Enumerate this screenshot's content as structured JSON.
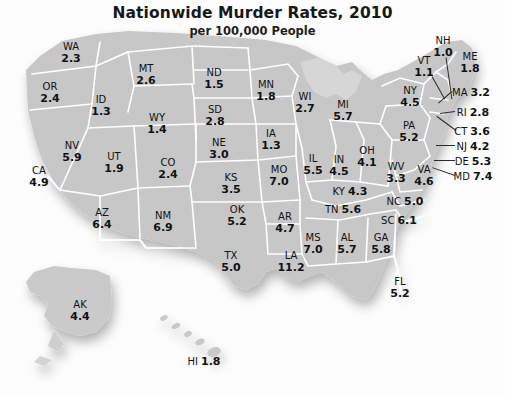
{
  "title": {
    "main": "Nationwide Murder Rates, 2010",
    "subtitle": "per 100,000 People"
  },
  "chart_data": {
    "type": "map",
    "title": "Nationwide Murder Rates, 2010",
    "subtitle": "per 100,000 People",
    "unit": "murders per 100,000 people",
    "region": "United States",
    "year": 2010,
    "value_range": [
      1.0,
      11.2
    ],
    "min_state": "NH",
    "max_state": "LA",
    "legend": "none",
    "grid": false,
    "categories": [
      "WA",
      "OR",
      "CA",
      "NV",
      "ID",
      "MT",
      "WY",
      "UT",
      "AZ",
      "CO",
      "NM",
      "ND",
      "SD",
      "NE",
      "KS",
      "OK",
      "TX",
      "MN",
      "IA",
      "MO",
      "AR",
      "LA",
      "WI",
      "IL",
      "MS",
      "MI",
      "IN",
      "KY",
      "TN",
      "AL",
      "GA",
      "FL",
      "OH",
      "WV",
      "VA",
      "NC",
      "SC",
      "PA",
      "NY",
      "VT",
      "NH",
      "ME",
      "MA",
      "RI",
      "CT",
      "NJ",
      "DE",
      "MD",
      "AK",
      "HI"
    ],
    "values": [
      2.3,
      2.4,
      4.9,
      5.9,
      1.3,
      2.6,
      1.4,
      1.9,
      6.4,
      2.4,
      6.9,
      1.5,
      2.8,
      3.0,
      3.5,
      5.2,
      5.0,
      1.8,
      1.3,
      7.0,
      4.7,
      11.2,
      2.7,
      5.5,
      7.0,
      5.7,
      4.5,
      4.3,
      5.6,
      5.7,
      5.8,
      5.2,
      4.1,
      3.3,
      4.6,
      5.0,
      6.1,
      5.2,
      4.5,
      1.1,
      1.0,
      1.8,
      3.2,
      2.8,
      3.6,
      4.2,
      5.3,
      7.4,
      4.4,
      1.8
    ],
    "states": [
      {
        "abbr": "WA",
        "value": "2.3",
        "x": 71,
        "y": 52,
        "style": "stacked"
      },
      {
        "abbr": "OR",
        "value": "2.4",
        "x": 50,
        "y": 92,
        "style": "stacked"
      },
      {
        "abbr": "ID",
        "value": "1.3",
        "x": 101,
        "y": 105,
        "style": "stacked"
      },
      {
        "abbr": "MT",
        "value": "2.6",
        "x": 146,
        "y": 74,
        "style": "stacked"
      },
      {
        "abbr": "WY",
        "value": "1.4",
        "x": 157,
        "y": 123,
        "style": "stacked"
      },
      {
        "abbr": "NV",
        "value": "5.9",
        "x": 72,
        "y": 151,
        "style": "stacked"
      },
      {
        "abbr": "UT",
        "value": "1.9",
        "x": 114,
        "y": 162,
        "style": "stacked"
      },
      {
        "abbr": "CA",
        "value": "4.9",
        "x": 39,
        "y": 176,
        "style": "stacked"
      },
      {
        "abbr": "CO",
        "value": "2.4",
        "x": 168,
        "y": 168,
        "style": "stacked"
      },
      {
        "abbr": "AZ",
        "value": "6.4",
        "x": 102,
        "y": 218,
        "style": "stacked"
      },
      {
        "abbr": "NM",
        "value": "6.9",
        "x": 163,
        "y": 221,
        "style": "stacked"
      },
      {
        "abbr": "ND",
        "value": "1.5",
        "x": 214,
        "y": 78,
        "style": "stacked"
      },
      {
        "abbr": "SD",
        "value": "2.8",
        "x": 215,
        "y": 115,
        "style": "stacked"
      },
      {
        "abbr": "NE",
        "value": "3.0",
        "x": 219,
        "y": 148,
        "style": "stacked"
      },
      {
        "abbr": "KS",
        "value": "3.5",
        "x": 231,
        "y": 183,
        "style": "stacked"
      },
      {
        "abbr": "OK",
        "value": "5.2",
        "x": 237,
        "y": 215,
        "style": "stacked"
      },
      {
        "abbr": "TX",
        "value": "5.0",
        "x": 231,
        "y": 261,
        "style": "stacked"
      },
      {
        "abbr": "MN",
        "value": "1.8",
        "x": 266,
        "y": 90,
        "style": "stacked"
      },
      {
        "abbr": "IA",
        "value": "1.3",
        "x": 271,
        "y": 139,
        "style": "stacked"
      },
      {
        "abbr": "MO",
        "value": "7.0",
        "x": 279,
        "y": 175,
        "style": "stacked"
      },
      {
        "abbr": "AR",
        "value": "4.7",
        "x": 285,
        "y": 222,
        "style": "stacked"
      },
      {
        "abbr": "LA",
        "value": "11.2",
        "x": 291,
        "y": 261,
        "style": "stacked"
      },
      {
        "abbr": "WI",
        "value": "2.7",
        "x": 305,
        "y": 102,
        "style": "stacked"
      },
      {
        "abbr": "IL",
        "value": "5.5",
        "x": 313,
        "y": 164,
        "style": "stacked"
      },
      {
        "abbr": "MS",
        "value": "7.0",
        "x": 313,
        "y": 243,
        "style": "stacked"
      },
      {
        "abbr": "MI",
        "value": "5.7",
        "x": 343,
        "y": 110,
        "style": "stacked"
      },
      {
        "abbr": "IN",
        "value": "4.5",
        "x": 339,
        "y": 165,
        "style": "stacked"
      },
      {
        "abbr": "KY",
        "value": "4.3",
        "x": 350,
        "y": 190,
        "style": "inline"
      },
      {
        "abbr": "TN",
        "value": "5.6",
        "x": 343,
        "y": 208,
        "style": "inline"
      },
      {
        "abbr": "AL",
        "value": "5.7",
        "x": 347,
        "y": 243,
        "style": "stacked"
      },
      {
        "abbr": "GA",
        "value": "5.8",
        "x": 381,
        "y": 243,
        "style": "stacked"
      },
      {
        "abbr": "FL",
        "value": "5.2",
        "x": 400,
        "y": 287,
        "style": "stacked"
      },
      {
        "abbr": "OH",
        "value": "4.1",
        "x": 367,
        "y": 156,
        "style": "stacked"
      },
      {
        "abbr": "WV",
        "value": "3.3",
        "x": 396,
        "y": 172,
        "style": "stacked"
      },
      {
        "abbr": "VA",
        "value": "4.6",
        "x": 424,
        "y": 175,
        "style": "stacked"
      },
      {
        "abbr": "NC",
        "value": "5.0",
        "x": 405,
        "y": 200,
        "style": "inline"
      },
      {
        "abbr": "SC",
        "value": "6.1",
        "x": 399,
        "y": 219,
        "style": "inline"
      },
      {
        "abbr": "PA",
        "value": "5.2",
        "x": 409,
        "y": 131,
        "style": "stacked"
      },
      {
        "abbr": "NY",
        "value": "4.5",
        "x": 410,
        "y": 96,
        "style": "stacked"
      },
      {
        "abbr": "VT",
        "value": "1.1",
        "x": 424,
        "y": 66,
        "style": "stacked"
      },
      {
        "abbr": "NH",
        "value": "1.0",
        "x": 443,
        "y": 46,
        "style": "stacked"
      },
      {
        "abbr": "ME",
        "value": "1.8",
        "x": 470,
        "y": 62,
        "style": "stacked"
      },
      {
        "abbr": "MA",
        "value": "3.2",
        "x": 471,
        "y": 91,
        "style": "inline"
      },
      {
        "abbr": "RI",
        "value": "2.8",
        "x": 473,
        "y": 111,
        "style": "inline"
      },
      {
        "abbr": "CT",
        "value": "3.6",
        "x": 472,
        "y": 130,
        "style": "inline"
      },
      {
        "abbr": "NJ",
        "value": "4.2",
        "x": 473,
        "y": 145,
        "style": "inline"
      },
      {
        "abbr": "DE",
        "value": "5.3",
        "x": 473,
        "y": 160,
        "style": "inline"
      },
      {
        "abbr": "MD",
        "value": "7.4",
        "x": 473,
        "y": 175,
        "style": "inline"
      },
      {
        "abbr": "AK",
        "value": "4.4",
        "x": 80,
        "y": 310,
        "style": "stacked"
      },
      {
        "abbr": "HI",
        "value": "1.8",
        "x": 204,
        "y": 360,
        "style": "inline"
      }
    ],
    "leader_lines": [
      {
        "name": "vt",
        "x1": 432,
        "y1": 76,
        "x2": 445,
        "y2": 99
      },
      {
        "name": "nh",
        "x1": 446,
        "y1": 57,
        "x2": 452,
        "y2": 99
      },
      {
        "name": "ma",
        "x1": 452,
        "y1": 91,
        "x2": 438,
        "y2": 103
      },
      {
        "name": "ri",
        "x1": 455,
        "y1": 111,
        "x2": 440,
        "y2": 113
      },
      {
        "name": "ct",
        "x1": 456,
        "y1": 130,
        "x2": 437,
        "y2": 116
      },
      {
        "name": "nj",
        "x1": 455,
        "y1": 145,
        "x2": 436,
        "y2": 145
      },
      {
        "name": "de",
        "x1": 455,
        "y1": 160,
        "x2": 434,
        "y2": 160
      },
      {
        "name": "md",
        "x1": 455,
        "y1": 175,
        "x2": 432,
        "y2": 167
      }
    ]
  }
}
